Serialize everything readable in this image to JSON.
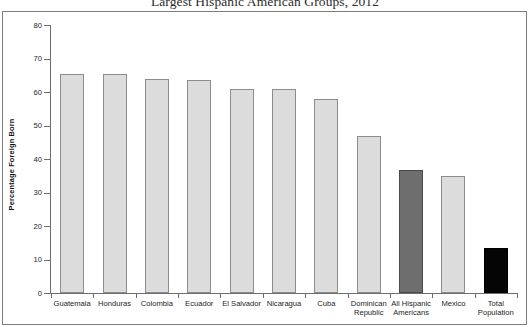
{
  "chart_data": {
    "type": "bar",
    "title": "Largest Hispanic American Groups, 2012",
    "xlabel": "",
    "ylabel": "Percentage Foreign Born",
    "ylim": [
      0,
      80
    ],
    "ytick_labels": [
      "0",
      "10",
      "20",
      "30",
      "40",
      "50",
      "60",
      "70",
      "80"
    ],
    "ytick_values": [
      0,
      10,
      20,
      30,
      40,
      50,
      60,
      70,
      80
    ],
    "grid": false,
    "legend": "none",
    "categories": [
      "Guatemala",
      "Honduras",
      "Colombia",
      "Ecuador",
      "El Salvador",
      "Nicaragua",
      "Cuba",
      "Dominican\nRepublic",
      "All Hispanic\nAmericans",
      "Mexico",
      "Total\nPopulation"
    ],
    "values": [
      65.5,
      65.5,
      64,
      63.5,
      61,
      61,
      58,
      47,
      36.7,
      35,
      13.4
    ],
    "bar_styles": [
      "light",
      "light",
      "light",
      "light",
      "light",
      "light",
      "light",
      "light",
      "medium",
      "light",
      "dark"
    ],
    "colors": {
      "light_fill": "#dcdcdc",
      "light_border": "#8c8c8c",
      "medium_fill": "#6e6e6e",
      "medium_border": "#4a4a4a",
      "dark_fill": "#050505",
      "dark_border": "#000000",
      "axis": "#6e6e6e",
      "frame": "#7d7d7d",
      "text": "#1d1d1d",
      "background": "#ffffff"
    }
  }
}
